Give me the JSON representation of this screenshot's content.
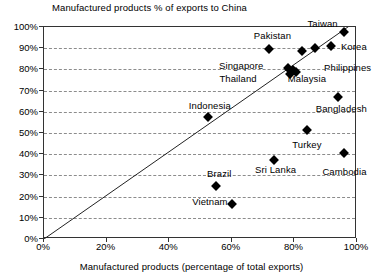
{
  "chart_data": {
    "type": "scatter",
    "title": "Manufactured products % of exports to China",
    "xlabel": "Manufactured products (percentage of total exports)",
    "ylabel": "",
    "xlim": [
      0,
      100
    ],
    "ylim": [
      0,
      100
    ],
    "grid": true,
    "legend": "none",
    "xtick_labels": [
      "0%",
      "20%",
      "40%",
      "60%",
      "80%",
      "100%"
    ],
    "xticks": [
      0,
      20,
      40,
      60,
      80,
      100
    ],
    "ytick_labels": [
      "0%",
      "10%",
      "20%",
      "30%",
      "40%",
      "50%",
      "60%",
      "70%",
      "80%",
      "90%",
      "100%"
    ],
    "yticks": [
      0,
      10,
      20,
      30,
      40,
      50,
      60,
      70,
      80,
      90,
      100
    ],
    "annotations": [
      {
        "text": "Taiwan",
        "x": 89,
        "y": 102
      },
      {
        "text": "Korea",
        "x": 99,
        "y": 91
      },
      {
        "text": "Pakistan",
        "x": 73,
        "y": 96
      },
      {
        "text": "Philippines",
        "x": 97,
        "y": 81
      },
      {
        "text": "Singapore",
        "x": 63,
        "y": 82
      },
      {
        "text": "Thailand",
        "x": 62,
        "y": 76
      },
      {
        "text": "Malaysia",
        "x": 84,
        "y": 76
      },
      {
        "text": "Indonesia",
        "x": 53,
        "y": 63
      },
      {
        "text": "Bangladesh",
        "x": 95,
        "y": 62
      },
      {
        "text": "Turkey",
        "x": 84,
        "y": 45
      },
      {
        "text": "Sri Lanka",
        "x": 74,
        "y": 33
      },
      {
        "text": "Cambodia",
        "x": 96,
        "y": 32
      },
      {
        "text": "Brazil",
        "x": 56,
        "y": 31
      },
      {
        "text": "Vietnam",
        "x": 53,
        "y": 18
      }
    ],
    "points": [
      {
        "name": "Taiwan",
        "x": 96.0,
        "y": 97.5
      },
      {
        "name": "Korea",
        "x": 91.7,
        "y": 91.0
      },
      {
        "name": "Pakistan",
        "x": 72.0,
        "y": 89.5
      },
      {
        "name": "Philippines-a",
        "x": 82.5,
        "y": 88.5
      },
      {
        "name": "Philippines-b",
        "x": 86.5,
        "y": 90.0
      },
      {
        "name": "Cluster-Thailand",
        "x": 78.0,
        "y": 80.5
      },
      {
        "name": "Cluster-Singapore",
        "x": 79.5,
        "y": 79.5
      },
      {
        "name": "Cluster-Malaysia",
        "x": 78.5,
        "y": 78.0
      },
      {
        "name": "Cluster-extra",
        "x": 80.5,
        "y": 79.0
      },
      {
        "name": "Bangladesh",
        "x": 94.0,
        "y": 67.0
      },
      {
        "name": "Indonesia",
        "x": 52.5,
        "y": 57.5
      },
      {
        "name": "Turkey",
        "x": 84.0,
        "y": 51.5
      },
      {
        "name": "Cambodia",
        "x": 96.0,
        "y": 40.5
      },
      {
        "name": "Sri Lanka",
        "x": 73.5,
        "y": 37.5
      },
      {
        "name": "Brazil",
        "x": 55.0,
        "y": 25.0
      },
      {
        "name": "Vietnam",
        "x": 60.0,
        "y": 16.5
      }
    ],
    "trendline": {
      "x0": 0,
      "y0": 0,
      "x1": 100,
      "y1": 103,
      "description": "diagonal reference line from origin"
    },
    "colors": {
      "marker": "#000000",
      "grid": "#8c8c8c",
      "axis": "#333333",
      "background": "#ffffff"
    }
  }
}
